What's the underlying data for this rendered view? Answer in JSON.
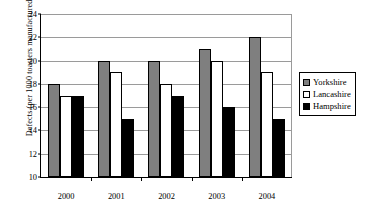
{
  "chart_data": {
    "type": "bar",
    "title": "",
    "xlabel": "",
    "ylabel": "Defects (per 1000 toasters manufactured)",
    "categories": [
      "2000",
      "2001",
      "2002",
      "2003",
      "2004"
    ],
    "series": [
      {
        "name": "Yorkshire",
        "color": "#7f7f7f",
        "values": [
          18,
          20,
          20,
          21,
          22
        ]
      },
      {
        "name": "Lancashire",
        "color": "#ffffff",
        "values": [
          17,
          19,
          18,
          20,
          19
        ]
      },
      {
        "name": "Hampshire",
        "color": "#000000",
        "values": [
          17,
          15,
          17,
          16,
          15
        ]
      }
    ],
    "ylim": [
      10,
      24
    ],
    "ytick_labels": [
      "24",
      "22",
      "20",
      "18",
      "16",
      "14",
      "12",
      "10"
    ],
    "yticks": [
      24,
      22,
      20,
      18,
      16,
      14,
      12,
      10
    ],
    "grid": true,
    "legend_position": "right"
  },
  "legend": {
    "items": [
      {
        "label": "Yorkshire"
      },
      {
        "label": "Lancashire"
      },
      {
        "label": "Hampshire"
      }
    ]
  }
}
